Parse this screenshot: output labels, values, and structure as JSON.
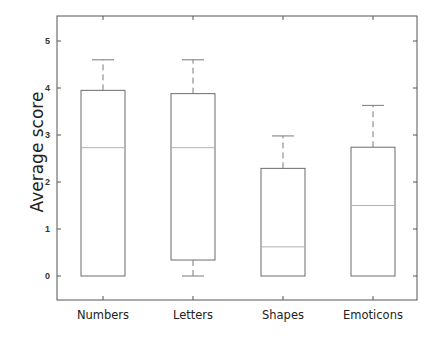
{
  "chart_data": {
    "type": "box",
    "title": "",
    "xlabel": "",
    "ylabel": "Average score",
    "ylim": [
      -0.5,
      5.5
    ],
    "yticks": [
      0,
      1,
      2,
      3,
      4,
      5
    ],
    "grid": false,
    "legend": null,
    "categories": [
      "Numbers",
      "Letters",
      "Shapes",
      "Emoticons"
    ],
    "boxes": [
      {
        "name": "Numbers",
        "whisker_low": 0,
        "q1": 0,
        "median": 2.73,
        "q3": 3.95,
        "whisker_high": 4.6
      },
      {
        "name": "Letters",
        "whisker_low": 0,
        "q1": 0.34,
        "median": 2.73,
        "q3": 3.88,
        "whisker_high": 4.6
      },
      {
        "name": "Shapes",
        "whisker_low": 0,
        "q1": 0,
        "median": 0.62,
        "q3": 2.29,
        "whisker_high": 2.98
      },
      {
        "name": "Emoticons",
        "whisker_low": 0,
        "q1": 0,
        "median": 1.5,
        "q3": 2.74,
        "whisker_high": 3.63
      }
    ]
  },
  "colors": {
    "axis": "#555555",
    "box_edge": "#6b6b6b",
    "median": "#b0b0b0",
    "whisker": "#7a7a7a"
  }
}
